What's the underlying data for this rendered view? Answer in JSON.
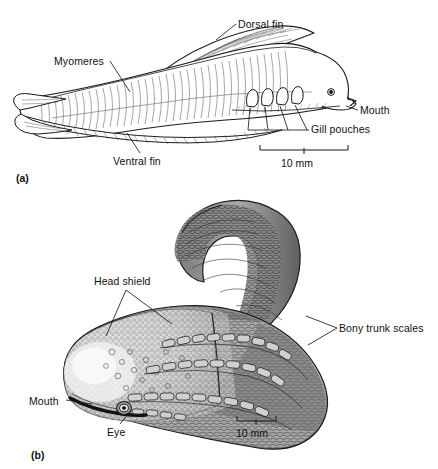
{
  "figure": {
    "background_color": "#ffffff",
    "ink_color": "#111111",
    "panels": [
      {
        "tag": "(a)",
        "tag_x": 16,
        "tag_y": 172,
        "subject": "lancelet-like-fossil-lateral-view",
        "labels": [
          {
            "name": "dorsal-fin",
            "text": "Dorsal fin",
            "x": 238,
            "y": 19
          },
          {
            "name": "myomeres",
            "text": "Myomeres",
            "x": 54,
            "y": 56
          },
          {
            "name": "mouth",
            "text": "Mouth",
            "x": 360,
            "y": 105
          },
          {
            "name": "gill-pouches",
            "text": "Gill pouches",
            "x": 311,
            "y": 124
          },
          {
            "name": "ventral-fin",
            "text": "Ventral fin",
            "x": 113,
            "y": 156
          }
        ],
        "scale_bar": {
          "caption": "10 mm",
          "caption_x": 281,
          "caption_y": 157,
          "x1": 260,
          "x2": 348,
          "y": 150
        }
      },
      {
        "tag": "(b)",
        "tag_x": 31,
        "tag_y": 449,
        "subject": "ostracoderm-armoured-fish-oblique-view",
        "labels": [
          {
            "name": "head-shield",
            "text": "Head shield",
            "x": 94,
            "y": 276
          },
          {
            "name": "bony-trunk-scales",
            "text": "Bony trunk scales",
            "x": 339,
            "y": 323
          },
          {
            "name": "mouth",
            "text": "Mouth",
            "x": 29,
            "y": 396
          },
          {
            "name": "eye",
            "text": "Eye",
            "x": 107,
            "y": 427
          }
        ],
        "scale_bar": {
          "caption": "10 mm",
          "caption_x": 236,
          "caption_y": 427,
          "x1": 237,
          "x2": 276,
          "y": 421
        }
      }
    ]
  }
}
